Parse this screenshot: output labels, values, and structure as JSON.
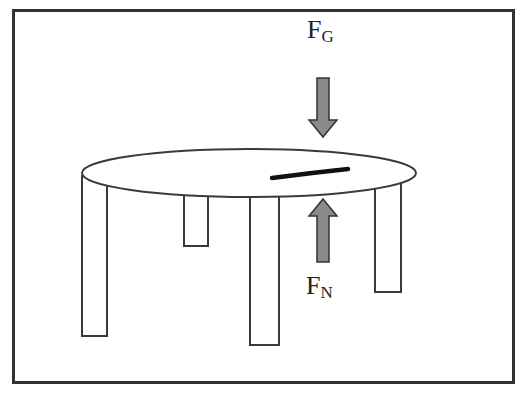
{
  "diagram": {
    "labels": {
      "gravity": {
        "main": "F",
        "sub": "G"
      },
      "normal": {
        "main": "F",
        "sub": "N"
      }
    },
    "colors": {
      "frame": "#333333",
      "outline": "#3a3a3a",
      "arrow_fill": "#8a8a8a",
      "object": "#111111",
      "background": "#ffffff"
    },
    "elements": [
      "frame",
      "table-top",
      "table-leg x4",
      "object-on-table",
      "gravity-arrow (down)",
      "normal-force-arrow (up)"
    ]
  }
}
